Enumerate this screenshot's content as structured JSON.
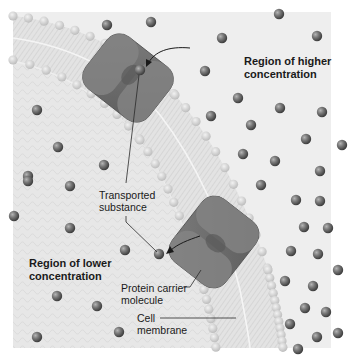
{
  "figure": {
    "background_color": "#eeeeee",
    "membrane_color": "#d9d9d9",
    "protein_color": "#6e6e6e",
    "molecule_color": "#6a6a6a"
  },
  "labels": {
    "higher_region": "Region of higher\nconcentration",
    "lower_region": "Region of lower\nconcentration",
    "transported_substance": "Transported\nsubstance",
    "protein_carrier": "Protein carrier\nmolecule",
    "cell_membrane": "Cell\nmembrane"
  },
  "molecules": [
    [
      107,
      25
    ],
    [
      151,
      22
    ],
    [
      37,
      110
    ],
    [
      58,
      147
    ],
    [
      104,
      165
    ],
    [
      28,
      176
    ],
    [
      279,
      14
    ],
    [
      222,
      38
    ],
    [
      317,
      36
    ],
    [
      205,
      71
    ],
    [
      238,
      98
    ],
    [
      280,
      108
    ],
    [
      322,
      112
    ],
    [
      211,
      116
    ],
    [
      251,
      125
    ],
    [
      306,
      139
    ],
    [
      342,
      145
    ],
    [
      243,
      154
    ],
    [
      275,
      161
    ],
    [
      320,
      171
    ],
    [
      28,
      181
    ],
    [
      70,
      186
    ],
    [
      14,
      216
    ],
    [
      70,
      228
    ],
    [
      125,
      250
    ],
    [
      57,
      296
    ],
    [
      97,
      306
    ],
    [
      119,
      332
    ],
    [
      37,
      337
    ],
    [
      261,
      185
    ],
    [
      296,
      200
    ],
    [
      320,
      201
    ],
    [
      304,
      227
    ],
    [
      328,
      228
    ],
    [
      291,
      251
    ],
    [
      318,
      254
    ],
    [
      338,
      270
    ],
    [
      285,
      281
    ],
    [
      313,
      286
    ],
    [
      305,
      308
    ],
    [
      326,
      312
    ],
    [
      290,
      324
    ],
    [
      317,
      337
    ],
    [
      338,
      333
    ],
    [
      298,
      349
    ]
  ],
  "transported_molecules": [
    [
      140,
      70
    ],
    [
      159,
      254
    ]
  ]
}
